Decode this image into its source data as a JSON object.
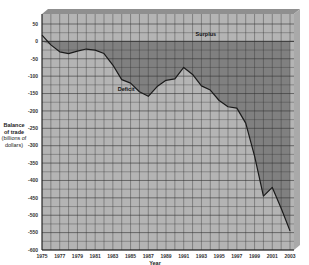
{
  "chart_data": {
    "type": "area",
    "title": "",
    "xlabel": "Year",
    "ylabel": "Balance of trade (billions of dollars)",
    "ylabel_lines": [
      "Balance",
      "of trade",
      "(billions of",
      "dollars)"
    ],
    "ylim": [
      -600,
      50
    ],
    "yticks": [
      50,
      0,
      -50,
      -100,
      -150,
      -200,
      -250,
      -300,
      -350,
      -400,
      -450,
      -500,
      -550,
      -600
    ],
    "xticks": [
      "1975",
      "1977",
      "1979",
      "1981",
      "1983",
      "1985",
      "1987",
      "1989",
      "1991",
      "1993",
      "1995",
      "1997",
      "1999",
      "2001",
      "2003"
    ],
    "grid": true,
    "annotations": [
      {
        "text": "Surplus",
        "x": 1993.5,
        "y": 20
      },
      {
        "text": "Deficit",
        "x": 1984.5,
        "y": -138
      }
    ],
    "series": [
      {
        "name": "Balance of trade",
        "x": [
          1975,
          1976,
          1977,
          1978,
          1979,
          1980,
          1981,
          1982,
          1983,
          1984,
          1985,
          1986,
          1987,
          1988,
          1989,
          1990,
          1991,
          1992,
          1993,
          1994,
          1995,
          1996,
          1997,
          1998,
          1999,
          2000,
          2001,
          2002,
          2003
        ],
        "values": [
          18,
          -10,
          -30,
          -35,
          -28,
          -22,
          -25,
          -35,
          -68,
          -110,
          -120,
          -145,
          -158,
          -130,
          -112,
          -108,
          -75,
          -95,
          -128,
          -140,
          -170,
          -188,
          -192,
          -235,
          -330,
          -445,
          -420,
          -480,
          -545
        ]
      }
    ]
  },
  "colors": {
    "plot_bg": "#b4b4b4",
    "deficit_fill": "#808080",
    "grid": "#333333",
    "line": "#1a1a1a",
    "frame_top": "#8c8c8c",
    "frame_side": "#a8a8a8"
  }
}
